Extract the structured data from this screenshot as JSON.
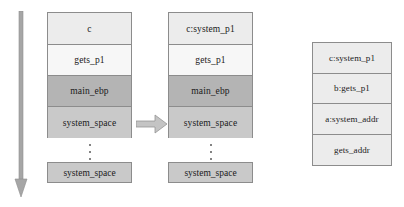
{
  "figure": {
    "background": "#ffffff",
    "border_color": "#8c8c8c",
    "arrow_color": "#a6a6a6",
    "arrow_edge_color": "#8c8c8c",
    "text_color": "#1a1a1a"
  },
  "time_arrow": {
    "icon": "down-arrow-icon",
    "direction": "down",
    "color": "#a6a6a6"
  },
  "transition_arrow": {
    "icon": "right-arrow-icon",
    "direction": "right",
    "color": "#bdbdbd"
  },
  "stacks": [
    {
      "id": "stack-main-a",
      "name": "stack-before",
      "cells": [
        {
          "label": "c",
          "fill": "#ececec"
        },
        {
          "label": "gets_p1",
          "fill": "#f7f7f7"
        },
        {
          "label": "main_ebp",
          "fill": "#b4b4b4"
        },
        {
          "label": "system_space",
          "fill": "#c9c9c9"
        }
      ],
      "ellipsis": "vertical-ellipsis",
      "tail": {
        "label": "system_space",
        "fill": "#c9c9c9"
      }
    },
    {
      "id": "stack-main-b",
      "name": "stack-after",
      "cells": [
        {
          "label": "c:system_p1",
          "fill": "#ececec"
        },
        {
          "label": "gets_p1",
          "fill": "#f7f7f7"
        },
        {
          "label": "main_ebp",
          "fill": "#b4b4b4"
        },
        {
          "label": "system_space",
          "fill": "#c9c9c9"
        }
      ],
      "ellipsis": "vertical-ellipsis",
      "tail": {
        "label": "system_space",
        "fill": "#c9c9c9"
      }
    },
    {
      "id": "stack-args",
      "name": "argument-layout",
      "cells": [
        {
          "label": "c:system_p1",
          "fill": "#ececec"
        },
        {
          "label": "b:gets_p1",
          "fill": "#ececec"
        },
        {
          "label": "a:system_addr",
          "fill": "#ececec"
        },
        {
          "label": "gets_addr",
          "fill": "#ececec"
        }
      ]
    }
  ]
}
